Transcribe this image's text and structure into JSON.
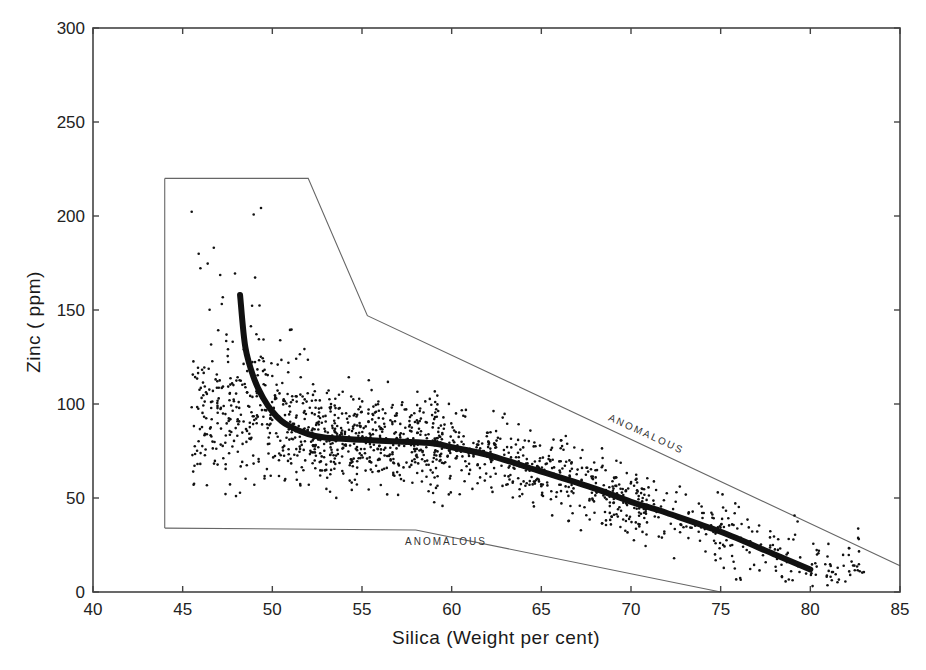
{
  "chart_data": {
    "type": "scatter",
    "title": "",
    "xlabel": "Silica (Weight per cent)",
    "ylabel": "Zinc ( ppm)",
    "xlim": [
      40,
      85
    ],
    "ylim": [
      0,
      300
    ],
    "x_ticks": [
      40,
      45,
      50,
      55,
      60,
      65,
      70,
      75,
      80,
      85
    ],
    "y_ticks": [
      0,
      50,
      100,
      150,
      200,
      250,
      300
    ],
    "grid": false,
    "legend": null,
    "series": [
      {
        "name": "samples",
        "kind": "scatter",
        "description": "Dense cloud of ~1500 sample points, densest at 47-60% silica with zinc 60-110 ppm, thinning and declining toward 80% silica",
        "density_bands": [
          {
            "x_range": [
              44,
              48
            ],
            "y_range": [
              40,
              205
            ]
          },
          {
            "x_range": [
              48,
              52
            ],
            "y_range": [
              40,
              200
            ]
          },
          {
            "x_range": [
              52,
              56
            ],
            "y_range": [
              35,
              160
            ]
          },
          {
            "x_range": [
              56,
              60
            ],
            "y_range": [
              35,
              130
            ]
          },
          {
            "x_range": [
              60,
              65
            ],
            "y_range": [
              25,
              115
            ]
          },
          {
            "x_range": [
              65,
              70
            ],
            "y_range": [
              15,
              95
            ]
          },
          {
            "x_range": [
              70,
              75
            ],
            "y_range": [
              5,
              75
            ]
          },
          {
            "x_range": [
              75,
              80
            ],
            "y_range": [
              0,
              50
            ]
          },
          {
            "x_range": [
              80,
              84
            ],
            "y_range": [
              15,
              35
            ]
          }
        ]
      },
      {
        "name": "trend",
        "kind": "line",
        "x": [
          48.2,
          48.5,
          49,
          49.5,
          50,
          50.5,
          51,
          52,
          53,
          55,
          57,
          59,
          60,
          62,
          65,
          68,
          70,
          72,
          75,
          78,
          80
        ],
        "values": [
          158,
          130,
          113,
          103,
          96,
          91,
          88,
          84,
          82,
          81,
          80,
          79,
          77,
          73,
          64,
          55,
          48,
          42,
          32,
          20,
          12
        ]
      }
    ],
    "envelope": {
      "upper_boundary": {
        "x": [
          44,
          52,
          55.3,
          85
        ],
        "y": [
          220,
          220,
          147,
          14
        ],
        "label": "ANOMALOUS"
      },
      "left_boundary": {
        "x": [
          44,
          44
        ],
        "y": [
          220,
          34
        ]
      },
      "lower_boundary": {
        "x": [
          44,
          58,
          75
        ],
        "y": [
          34,
          33,
          0
        ],
        "label": "ANOMALOUS"
      }
    },
    "annotations": [
      "ANOMALOUS",
      "ANOMALOUS"
    ]
  },
  "labels": {
    "xlabel": "Silica (Weight per cent)",
    "ylabel": "Zinc ( ppm)",
    "anomalous_upper": "ANOMALOUS",
    "anomalous_lower": "ANOMALOUS"
  },
  "colors": {
    "ink": "#111111",
    "axis": "#444444",
    "envelope": "#666666",
    "background": "#ffffff"
  }
}
